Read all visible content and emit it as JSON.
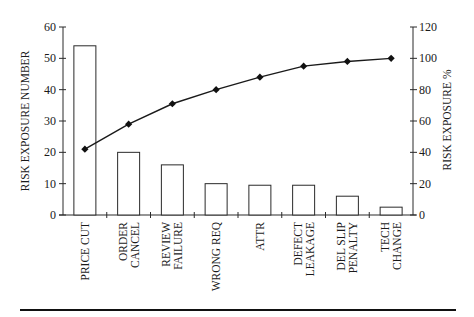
{
  "chart_data": {
    "type": "bar",
    "title": "",
    "xlabel": "",
    "ylabel": "RISK EXPOSURE NUMBER",
    "y2label": "RISK EXPOSURE %",
    "ylim": [
      0,
      60
    ],
    "y2lim": [
      0,
      120
    ],
    "yticks": [
      0,
      10,
      20,
      30,
      40,
      50,
      60
    ],
    "y2ticks": [
      0,
      20,
      40,
      60,
      80,
      100,
      120
    ],
    "grid": false,
    "legend": null,
    "categories": [
      [
        "PRICE CUT"
      ],
      [
        "ORDER",
        "CANCEL"
      ],
      [
        "REVIEW",
        "FAILURE"
      ],
      [
        "WRONG REQ"
      ],
      [
        "ATTR"
      ],
      [
        "DEFECT",
        "LEAKAGE"
      ],
      [
        "DEL SLIP",
        "PENALTY"
      ],
      [
        "TECH",
        "CHANGE"
      ]
    ],
    "series": [
      {
        "name": "Risk Exposure Number",
        "type": "bar",
        "axis": "left",
        "values": [
          54,
          20,
          16,
          10,
          9.5,
          9.5,
          6,
          2.5
        ]
      },
      {
        "name": "Cumulative Risk Exposure %",
        "type": "line",
        "axis": "right",
        "marker": "diamond",
        "values": [
          42,
          58,
          71,
          80,
          88,
          95,
          98,
          100
        ]
      }
    ]
  }
}
